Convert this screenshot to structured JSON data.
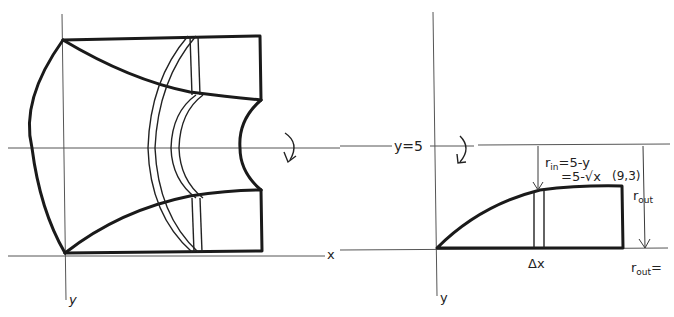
{
  "left_figure": {
    "description": "Solid of revolution about y = 5 with washer slice",
    "x_axis_label": "x",
    "y_axis_label": "y",
    "rotation_arrow": "curved-arrow-icon"
  },
  "right_figure": {
    "axis_line_label": "y=5",
    "y_axis_label": "y",
    "slice_label": "Δx",
    "point_label": "(9,3)",
    "r_in_label": "r",
    "r_in_sub": "in",
    "r_in_eq1": "=5-y",
    "r_in_eq2": "=5-√x",
    "r_out_label": "r",
    "r_out_sub": "out",
    "r_out_bottom_label": "r",
    "r_out_bottom_sub": "out",
    "r_out_bottom_eq": "="
  },
  "colors": {
    "ink": "#1a1a1a",
    "paper": "#ffffff"
  }
}
